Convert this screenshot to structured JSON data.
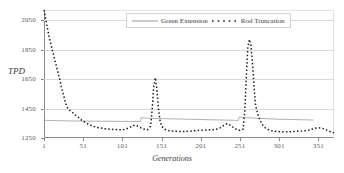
{
  "chart_data": {
    "type": "line",
    "title": "",
    "xlabel": "Generations",
    "ylabel": "TPD",
    "xlim": [
      1,
      371
    ],
    "ylim": [
      1250,
      2120
    ],
    "grid": true,
    "legend_position": "top-center",
    "yticks": [
      2050,
      1850,
      1650,
      1450,
      1250
    ],
    "xticks": [
      1,
      51,
      101,
      151,
      201,
      251,
      301,
      351
    ],
    "series": [
      {
        "name": "Green Extension",
        "style": "solid",
        "color": "#9a9a9a",
        "x": [
          1,
          5,
          9,
          13,
          17,
          21,
          25,
          29,
          33,
          41,
          49,
          57,
          65,
          73,
          81,
          89,
          97,
          105,
          113,
          121,
          124,
          125,
          129,
          133,
          141,
          149,
          157,
          165,
          173,
          181,
          189,
          197,
          205,
          213,
          221,
          229,
          237,
          245,
          249,
          250,
          254,
          258,
          266,
          274,
          282,
          290,
          298,
          306,
          314,
          322,
          330,
          338,
          345
        ],
        "values": [
          1370,
          1370,
          1369,
          1369,
          1368,
          1368,
          1367,
          1367,
          1366,
          1366,
          1365,
          1365,
          1364,
          1364,
          1364,
          1363,
          1363,
          1363,
          1362,
          1362,
          1362,
          1388,
          1386,
          1385,
          1383,
          1382,
          1381,
          1380,
          1379,
          1378,
          1377,
          1376,
          1375,
          1374,
          1373,
          1372,
          1371,
          1370,
          1370,
          1392,
          1390,
          1388,
          1386,
          1384,
          1382,
          1380,
          1378,
          1377,
          1376,
          1375,
          1374,
          1373,
          1372
        ]
      },
      {
        "name": "Rod Truncation",
        "style": "dotted",
        "color": "#1c1c1c",
        "x": [
          1,
          3,
          5,
          7,
          9,
          11,
          13,
          15,
          17,
          19,
          21,
          23,
          25,
          27,
          29,
          31,
          33,
          37,
          41,
          45,
          49,
          53,
          57,
          61,
          65,
          69,
          73,
          77,
          81,
          85,
          89,
          93,
          97,
          101,
          105,
          109,
          113,
          117,
          121,
          125,
          129,
          133,
          137,
          139,
          141,
          143,
          145,
          147,
          149,
          151,
          155,
          159,
          163,
          167,
          171,
          175,
          179,
          183,
          187,
          191,
          195,
          199,
          203,
          207,
          211,
          215,
          219,
          223,
          227,
          231,
          235,
          239,
          243,
          247,
          251,
          255,
          257,
          259,
          261,
          263,
          265,
          267,
          269,
          271,
          275,
          279,
          283,
          287,
          291,
          295,
          299,
          303,
          307,
          311,
          315,
          319,
          323,
          327,
          331,
          335,
          339,
          343,
          347,
          351,
          355,
          359,
          363,
          367,
          371
        ],
        "values": [
          2120,
          2065,
          2010,
          1950,
          1905,
          1860,
          1820,
          1775,
          1735,
          1690,
          1650,
          1600,
          1560,
          1520,
          1480,
          1455,
          1440,
          1425,
          1405,
          1390,
          1372,
          1358,
          1345,
          1335,
          1328,
          1322,
          1318,
          1314,
          1312,
          1310,
          1308,
          1307,
          1306,
          1306,
          1310,
          1318,
          1330,
          1338,
          1330,
          1318,
          1310,
          1306,
          1330,
          1440,
          1600,
          1660,
          1580,
          1450,
          1370,
          1330,
          1310,
          1302,
          1298,
          1296,
          1295,
          1294,
          1294,
          1295,
          1296,
          1298,
          1300,
          1302,
          1303,
          1304,
          1305,
          1306,
          1308,
          1312,
          1322,
          1338,
          1348,
          1336,
          1320,
          1308,
          1302,
          1310,
          1420,
          1650,
          1860,
          1920,
          1880,
          1760,
          1600,
          1470,
          1390,
          1345,
          1320,
          1308,
          1300,
          1296,
          1294,
          1293,
          1292,
          1292,
          1293,
          1294,
          1295,
          1296,
          1298,
          1300,
          1304,
          1310,
          1316,
          1320,
          1318,
          1310,
          1300,
          1292,
          1286
        ]
      }
    ]
  },
  "legend": {
    "items": [
      {
        "label": "Green Extension"
      },
      {
        "label": "Rod Truncation"
      }
    ]
  }
}
